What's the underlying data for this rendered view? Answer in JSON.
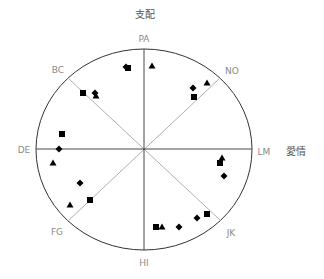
{
  "chart_data": {
    "type": "scatter",
    "subtype": "interpersonal-circumplex",
    "title": "",
    "axis_titles": {
      "vertical": "支配",
      "horizontal": "愛情"
    },
    "octant_labels": [
      "PA",
      "NO",
      "LM",
      "JK",
      "HI",
      "FG",
      "DE",
      "BC"
    ],
    "grid": false,
    "legend": null,
    "center": [
      144,
      149
    ],
    "radius": [
      108,
      100
    ],
    "series": [
      {
        "name": "square",
        "marker": "square",
        "points": [
          [
            128,
            68
          ],
          [
            83,
            93
          ],
          [
            194,
            97
          ],
          [
            62,
            134
          ],
          [
            220,
            163
          ],
          [
            90,
            200
          ],
          [
            156,
            227
          ],
          [
            207,
            214
          ]
        ]
      },
      {
        "name": "diamond",
        "marker": "diamond",
        "points": [
          [
            126,
            67
          ],
          [
            95,
            93
          ],
          [
            193,
            88
          ],
          [
            59,
            149
          ],
          [
            224,
            176
          ],
          [
            80,
            183
          ],
          [
            179,
            227
          ],
          [
            197,
            218
          ]
        ]
      },
      {
        "name": "triangle",
        "marker": "triangle",
        "points": [
          [
            152,
            66
          ],
          [
            96,
            96
          ],
          [
            207,
            83
          ],
          [
            53,
            163
          ],
          [
            222,
            158
          ],
          [
            70,
            205
          ],
          [
            162,
            227
          ]
        ]
      }
    ]
  },
  "labels": {
    "top_title": "支配",
    "right_title": "愛情",
    "PA": "PA",
    "NO": "NO",
    "LM": "LM",
    "JK": "JK",
    "HI": "HI",
    "FG": "FG",
    "DE": "DE",
    "BC": "BC"
  },
  "colors": {
    "circle": "#333333",
    "main_axes": "#333333",
    "diagonal_axes": "#999999",
    "markers": "#000000",
    "labels": "#8a8a8a"
  }
}
